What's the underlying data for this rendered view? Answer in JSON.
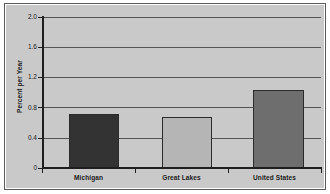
{
  "chart_data": {
    "type": "bar",
    "title": "",
    "subtitle": "",
    "xlabel": "",
    "ylabel": "Percent per Year",
    "categories": [
      "Michigan",
      "Great Lakes",
      "United States"
    ],
    "values": [
      0.72,
      0.68,
      1.03
    ],
    "series": [
      {
        "name": "Percent per Year",
        "values": [
          0.72,
          0.68,
          1.03
        ]
      }
    ],
    "bar_colors": [
      "#333333",
      "#b5b5b5",
      "#6e6e6e"
    ],
    "ylim": [
      0,
      2.0
    ],
    "ytick_labels": [
      "2.0",
      "1.6",
      "1.2",
      "0.8",
      "0.4",
      "0"
    ],
    "ytick_values": [
      2.0,
      1.6,
      1.2,
      0.8,
      0.4,
      0
    ],
    "grid": true,
    "grid_axis": "y",
    "legend": false,
    "legend_position": "none",
    "plot_background": "#c9c9c9",
    "figure_background": "#ffffff",
    "axis_color": "#1e1e1e",
    "gridline_color": "#555555"
  }
}
